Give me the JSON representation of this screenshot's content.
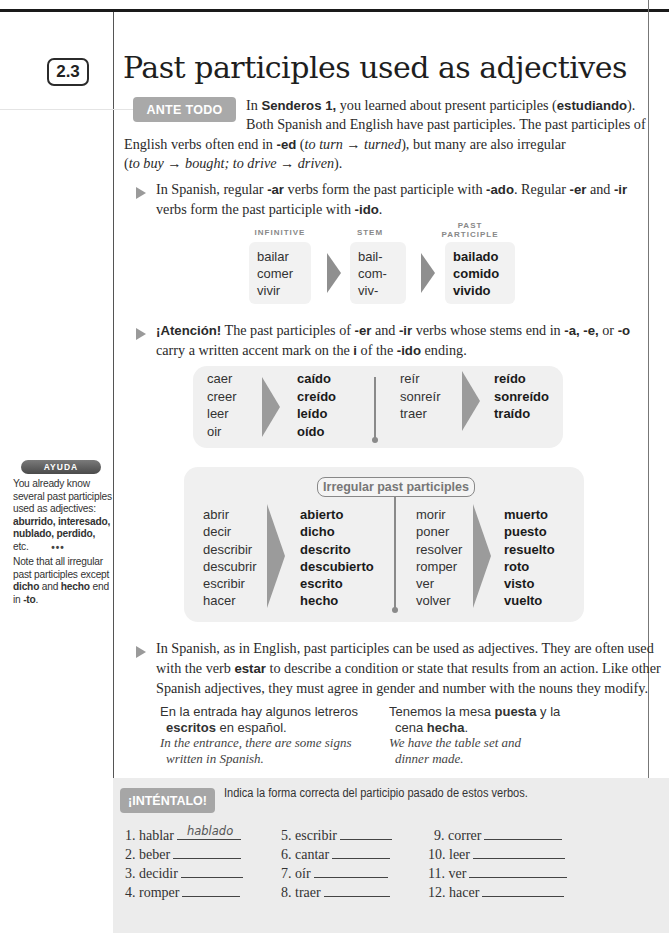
{
  "section": {
    "number": "2.3",
    "title": "Past participles used as adjectives"
  },
  "intro": {
    "badge": "ANTE TODO",
    "line1_pre": "In ",
    "line1_bold": "Senderos 1,",
    "line1_mid": " you learned about present participles (",
    "line1_bold2": "estudiando",
    "line1_post": ").",
    "line2": "Both Spanish and English have past participles. The past participles of",
    "line3_pre": "English verbs often end in ",
    "line3_bold": "-ed",
    "line3_paren_open": " (",
    "line3_ital": "to turn → turned",
    "line3_post": "), but many are also irregular",
    "line4_open": "(",
    "line4_ital": "to buy → bought; to drive → driven",
    "line4_close": ")."
  },
  "bullet1": {
    "l1_a": "In Spanish, regular ",
    "l1_b": "-ar",
    "l1_c": " verbs form the past participle with ",
    "l1_d": "-ado",
    "l1_e": ". Regular ",
    "l1_f": "-er",
    "l1_g": " and ",
    "l1_h": "-ir",
    "l2_a": "verbs form the past participle with ",
    "l2_b": "-ido",
    "l2_c": "."
  },
  "regular_table": {
    "headers": {
      "infinitive": "INFINITIVE",
      "stem": "STEM",
      "past1": "PAST",
      "past2": "PARTICIPLE"
    },
    "rows": [
      {
        "infinitive": "bailar",
        "stem": "bail-",
        "participle": "bailado"
      },
      {
        "infinitive": "comer",
        "stem": "com-",
        "participle": "comido"
      },
      {
        "infinitive": "vivir",
        "stem": "viv-",
        "participle": "vivido"
      }
    ]
  },
  "bullet2": {
    "l1_a": "¡Atención!",
    "l1_b": " The past participles of ",
    "l1_c": "-er",
    "l1_d": " and ",
    "l1_e": "-ir",
    "l1_f": " verbs whose stems end in ",
    "l1_g": "-a, -e,",
    "l1_h": " or ",
    "l1_i": "-o",
    "l2_a": "carry a written accent mark on the ",
    "l2_b": "i",
    "l2_c": " of the ",
    "l2_d": "-ido",
    "l2_e": " ending."
  },
  "accent_table": {
    "left_inf": [
      "caer",
      "creer",
      "leer",
      "oir"
    ],
    "left_part": [
      "caído",
      "creído",
      "leído",
      "oído"
    ],
    "right_inf": [
      "reír",
      "sonreír",
      "traer"
    ],
    "right_part": [
      "reído",
      "sonreído",
      "traído"
    ]
  },
  "irregular_table": {
    "label": "Irregular past participles",
    "left_inf": [
      "abrir",
      "decir",
      "describir",
      "descubrir",
      "escribir",
      "hacer"
    ],
    "left_part": [
      "abierto",
      "dicho",
      "descrito",
      "descubierto",
      "escrito",
      "hecho"
    ],
    "right_inf": [
      "morir",
      "poner",
      "resolver",
      "romper",
      "ver",
      "volver"
    ],
    "right_part": [
      "muerto",
      "puesto",
      "resuelto",
      "roto",
      "visto",
      "vuelto"
    ]
  },
  "ayuda": {
    "badge": "AYUDA",
    "p1": "You already know several past participles used as adjectives:",
    "p1_bold": "aburrido, interesado, nublado, perdido,",
    "p1_end": " etc.",
    "dots": "•••",
    "p2_a": "Note that all irregular past participles except ",
    "p2_b": "dicho",
    "p2_c": " and ",
    "p2_d": "hecho",
    "p2_e": " end in ",
    "p2_f": "-to",
    "p2_g": "."
  },
  "bullet3": {
    "l1": "In Spanish, as in English, past participles can be used as adjectives. They are often used",
    "l2_a": "with the verb ",
    "l2_b": "estar",
    "l2_c": " to describe a condition or state that results from an action. Like other",
    "l3": "Spanish adjectives, they must agree in gender and number with the nouns they modify."
  },
  "examples": [
    {
      "es1": "En la entrada hay algunos letreros",
      "es2_bold": "escritos",
      "es2_rest": " en español.",
      "en1": "In the entrance, there are some signs",
      "en2": "written in Spanish."
    },
    {
      "es1_a": "Tenemos la mesa ",
      "es1_bold": "puesta",
      "es1_b": " y la",
      "es2_a": "cena ",
      "es2_bold": "hecha",
      "es2_b": ".",
      "en1": "We have the table set and",
      "en2": "dinner made."
    }
  ],
  "exercise": {
    "badge": "¡INTÉNTALO!",
    "instruction": "Indica la forma correcta del participio pasado de estos verbos.",
    "items": [
      {
        "n": "1.",
        "verb": "hablar",
        "answer": "hablado"
      },
      {
        "n": "2.",
        "verb": "beber",
        "answer": ""
      },
      {
        "n": "3.",
        "verb": "decidir",
        "answer": ""
      },
      {
        "n": "4.",
        "verb": "romper",
        "answer": ""
      },
      {
        "n": "5.",
        "verb": "escribir",
        "answer": ""
      },
      {
        "n": "6.",
        "verb": "cantar",
        "answer": ""
      },
      {
        "n": "7.",
        "verb": "oír",
        "answer": ""
      },
      {
        "n": "8.",
        "verb": "traer",
        "answer": ""
      },
      {
        "n": "9.",
        "verb": "correr",
        "answer": ""
      },
      {
        "n": "10.",
        "verb": "leer",
        "answer": ""
      },
      {
        "n": "11.",
        "verb": "ver",
        "answer": ""
      },
      {
        "n": "12.",
        "verb": "hacer",
        "answer": ""
      }
    ]
  }
}
